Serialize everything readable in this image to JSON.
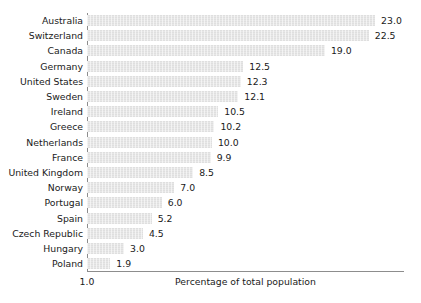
{
  "chart_data": {
    "type": "bar",
    "orientation": "horizontal",
    "title": "",
    "xlabel": "Percentage of total population",
    "ylabel": "",
    "grid": false,
    "legend": null,
    "xticks": [
      "1.0"
    ],
    "xlim": [
      1.0,
      25.5
    ],
    "categories": [
      "Australia",
      "Switzerland",
      "Canada",
      "Germany",
      "United States",
      "Sweden",
      "Ireland",
      "Greece",
      "Netherlands",
      "France",
      "United Kingdom",
      "Norway",
      "Portugal",
      "Spain",
      "Czech Republic",
      "Hungary",
      "Poland"
    ],
    "values": [
      23.0,
      22.5,
      19.0,
      12.5,
      12.3,
      12.1,
      10.5,
      10.2,
      10.0,
      9.9,
      8.5,
      7.0,
      6.0,
      5.2,
      4.5,
      3.0,
      1.9
    ],
    "value_labels": [
      "23.0",
      "22.5",
      "19.0",
      "12.5",
      "12.3",
      "12.1",
      "10.5",
      "10.2",
      "10.0",
      "9.9",
      "8.5",
      "7.0",
      "6.0",
      "5.2",
      "4.5",
      "3.0",
      "1.9"
    ],
    "colors": {
      "bar_fill": "#e7e7e7",
      "axis_line": "#8d8d8d",
      "text": "#1a1a1a",
      "background": "#ffffff"
    }
  }
}
